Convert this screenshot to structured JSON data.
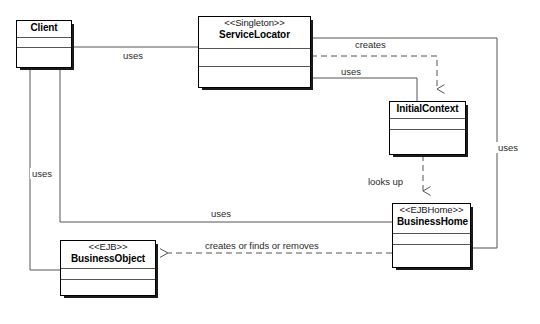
{
  "diagram": {
    "kind": "uml-class-diagram",
    "canvas": {
      "width": 540,
      "height": 324
    },
    "line_color": "#555555",
    "node_border_color": "#000000",
    "node_fill": "#ffffff",
    "shadow_color": "#1a1a1a",
    "label_color": "#2b2b2b"
  },
  "nodes": [
    {
      "id": "client",
      "name": "Client",
      "stereotype": "",
      "x": 16,
      "y": 20,
      "w": 56,
      "h": 48,
      "name_h": 17,
      "attr_h": 10
    },
    {
      "id": "service_locator",
      "name": "ServiceLocator",
      "stereotype": "<<Singleton>>",
      "x": 198,
      "y": 16,
      "w": 113,
      "h": 72,
      "name_h": 32,
      "attr_h": 18
    },
    {
      "id": "initial_context",
      "name": "InitialContext",
      "stereotype": "",
      "x": 389,
      "y": 101,
      "w": 77,
      "h": 54,
      "name_h": 17,
      "attr_h": 11
    },
    {
      "id": "business_home",
      "name": "BusinessHome",
      "stereotype": "<<EJBHome>>",
      "x": 392,
      "y": 203,
      "w": 79,
      "h": 65,
      "name_h": 30,
      "attr_h": 11
    },
    {
      "id": "business_object",
      "name": "BusinessObject",
      "stereotype": "<<EJB>>",
      "x": 60,
      "y": 240,
      "w": 96,
      "h": 56,
      "name_h": 28,
      "attr_h": 11
    }
  ],
  "edges": [
    {
      "id": "client-uses-servicelocator",
      "label": "uses",
      "from": "client",
      "to": "service_locator",
      "style": "solid",
      "arrow": "none",
      "label_x": 121,
      "label_y": 50
    },
    {
      "id": "servicelocator-creates-initialcontext",
      "label": "creates",
      "from": "service_locator",
      "to": "initial_context",
      "style": "dashed",
      "arrow": "open",
      "label_x": 353,
      "label_y": 39
    },
    {
      "id": "servicelocator-uses-initialcontext",
      "label": "uses",
      "from": "service_locator",
      "to": "initial_context",
      "style": "solid",
      "arrow": "none",
      "label_x": 339,
      "label_y": 66
    },
    {
      "id": "initialcontext-looksup-businesshome",
      "label": "looks up",
      "from": "initial_context",
      "to": "business_home",
      "style": "dashed",
      "arrow": "open",
      "label_x": 366,
      "label_y": 176
    },
    {
      "id": "servicelocator-uses-businesshome",
      "label": "uses",
      "from": "service_locator",
      "to": "business_home",
      "style": "solid",
      "arrow": "none",
      "label_x": 496,
      "label_y": 142
    },
    {
      "id": "client-uses-businesshome",
      "label": "uses",
      "from": "client",
      "to": "business_home",
      "style": "solid",
      "arrow": "none",
      "label_x": 209,
      "label_y": 208
    },
    {
      "id": "businesshome-creates-businessobject",
      "label": "creates or finds or removes",
      "from": "business_home",
      "to": "business_object",
      "style": "dashed",
      "arrow": "open",
      "label_x": 203,
      "label_y": 240
    },
    {
      "id": "client-uses-businessobject",
      "label": "uses",
      "from": "client",
      "to": "business_object",
      "style": "solid",
      "arrow": "none",
      "label_x": 30,
      "label_y": 168
    }
  ]
}
